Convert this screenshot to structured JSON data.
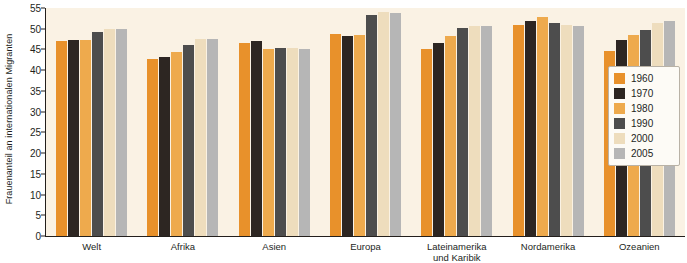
{
  "chart_data": {
    "type": "bar",
    "title": "",
    "xlabel": "",
    "ylabel": "Frauenanteil an internationalen Migranten",
    "ylim": [
      0,
      55
    ],
    "yticks": [
      0,
      5,
      10,
      15,
      20,
      25,
      30,
      35,
      40,
      45,
      50,
      55
    ],
    "grid": false,
    "legend_position": "right",
    "categories": [
      "Welt",
      "Afrika",
      "Asien",
      "Europa",
      "Lateinamerika\nund Karibik",
      "Nordamerika",
      "Ozeanien"
    ],
    "series": [
      {
        "name": "1960",
        "color": "#e8912b",
        "values": [
          47.0,
          42.6,
          46.6,
          48.8,
          45.2,
          50.9,
          44.6
        ]
      },
      {
        "name": "1970",
        "color": "#2d2622",
        "values": [
          47.4,
          43.1,
          47.1,
          48.2,
          46.6,
          51.8,
          47.2
        ]
      },
      {
        "name": "1980",
        "color": "#eeaa4d",
        "values": [
          47.4,
          44.4,
          45.0,
          48.6,
          48.2,
          52.9,
          48.6
        ]
      },
      {
        "name": "1990",
        "color": "#4d4d4d",
        "values": [
          49.3,
          46.1,
          45.4,
          53.3,
          50.2,
          51.3,
          49.7
        ]
      },
      {
        "name": "2000",
        "color": "#eeddbd",
        "values": [
          50.0,
          47.5,
          45.3,
          54.0,
          50.6,
          50.8,
          51.3
        ]
      },
      {
        "name": "2005",
        "color": "#b6b6b6",
        "values": [
          49.9,
          47.6,
          45.0,
          53.9,
          50.6,
          50.7,
          51.9
        ]
      }
    ]
  },
  "legend": {
    "items": [
      {
        "label": "1960",
        "color": "#e8912b"
      },
      {
        "label": "1970",
        "color": "#2d2622"
      },
      {
        "label": "1980",
        "color": "#eeaa4d"
      },
      {
        "label": "1990",
        "color": "#4d4d4d"
      },
      {
        "label": "2000",
        "color": "#eeddbd"
      },
      {
        "label": "2005",
        "color": "#b6b6b6"
      }
    ]
  },
  "colors": {
    "plot_background": "#faf2e4",
    "page_background": "#ffffff",
    "axis": "#231f1c",
    "text": "#231f1c",
    "legend_background": "#fdfbf6",
    "legend_border": "#b9b2a6"
  }
}
